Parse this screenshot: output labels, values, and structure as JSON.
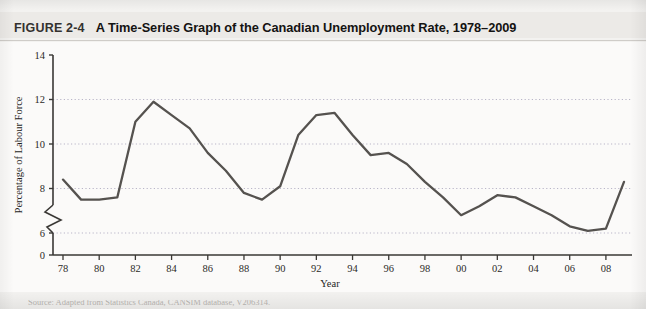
{
  "figure": {
    "label": "FIGURE 2-4",
    "caption": "A Time-Series Graph of the Canadian Unemployment Rate, 1978–2009"
  },
  "source_note": "Source: Adapted from Statistics Canada, CANSIM database, V206314.",
  "colors": {
    "page_background": "#f3f2f0",
    "header_band": "#eceae7",
    "plot_background": "#fbfaf9",
    "axis": "#3a3835",
    "gridline": "#b9b5c8",
    "series_line": "#55524f",
    "title_text": "#141312"
  },
  "chart_data": {
    "type": "line",
    "title": "A Time-Series Graph of the Canadian Unemployment Rate, 1978–2009",
    "xlabel": "Year",
    "ylabel": "Percentage of Labour Force",
    "xlim": [
      1978,
      2009
    ],
    "ylim": [
      6,
      14
    ],
    "y_axis_break": true,
    "y_axis_break_note": "Axis broken between 0 and 6",
    "ytick_labels": [
      "0",
      "6",
      "8",
      "10",
      "12",
      "14"
    ],
    "yticks": [
      0,
      6,
      8,
      10,
      12,
      14
    ],
    "gridlines": [
      6,
      8,
      10,
      12
    ],
    "grid": true,
    "legend": "none",
    "xtick_labels": [
      "78",
      "80",
      "82",
      "84",
      "86",
      "88",
      "90",
      "92",
      "94",
      "96",
      "98",
      "00",
      "02",
      "04",
      "06",
      "08"
    ],
    "xticks": [
      1978,
      1980,
      1982,
      1984,
      1986,
      1988,
      1990,
      1992,
      1994,
      1996,
      1998,
      2000,
      2002,
      2004,
      2006,
      2008
    ],
    "x": [
      1978,
      1979,
      1980,
      1981,
      1982,
      1983,
      1984,
      1985,
      1986,
      1987,
      1988,
      1989,
      1990,
      1991,
      1992,
      1993,
      1994,
      1995,
      1996,
      1997,
      1998,
      1999,
      2000,
      2001,
      2002,
      2003,
      2004,
      2005,
      2006,
      2007,
      2008,
      2009
    ],
    "series": [
      {
        "name": "Canadian Unemployment Rate",
        "values": [
          8.4,
          7.5,
          7.5,
          7.6,
          11.0,
          11.9,
          11.3,
          10.7,
          9.6,
          8.8,
          7.8,
          7.5,
          8.1,
          10.4,
          11.3,
          11.4,
          10.4,
          9.5,
          9.6,
          9.1,
          8.3,
          7.6,
          6.8,
          7.2,
          7.7,
          7.6,
          7.2,
          6.8,
          6.3,
          6.1,
          6.2,
          8.3
        ]
      }
    ]
  }
}
